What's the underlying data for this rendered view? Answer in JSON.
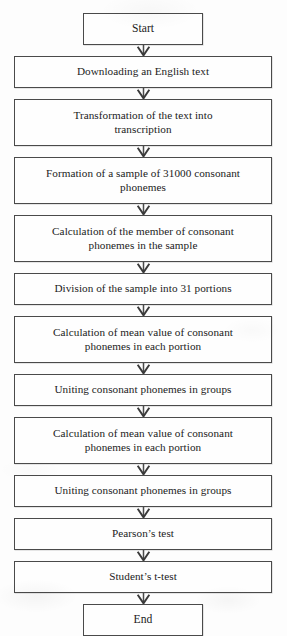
{
  "diagram": {
    "orientation": "top-to-bottom",
    "background_color": "#fdfdfd",
    "border_color": "#4a4a4a",
    "text_color": "#1b1b1b",
    "connector_glyph": "down-arrow",
    "connector_count": 11
  },
  "nodes": [
    {
      "id": "start",
      "shape": "terminal",
      "width": "narrow",
      "lines": 1,
      "label": "Start"
    },
    {
      "id": "download",
      "shape": "process",
      "width": "wide",
      "lines": 1,
      "label": "Downloading an English text"
    },
    {
      "id": "transform",
      "shape": "process",
      "width": "wide",
      "lines": 2,
      "label": "Transformation of the text into\ntranscription"
    },
    {
      "id": "formation",
      "shape": "process",
      "width": "wide",
      "lines": 2,
      "label": "Formation of a sample of 31000 consonant\nphonemes"
    },
    {
      "id": "calc-member",
      "shape": "process",
      "width": "wide",
      "lines": 2,
      "label": "Calculation of the member of consonant\nphonemes in the sample"
    },
    {
      "id": "division",
      "shape": "process",
      "width": "wide",
      "lines": 1,
      "label": "Division of the sample into 31 portions"
    },
    {
      "id": "calc-mean-1",
      "shape": "process",
      "width": "wide",
      "lines": 2,
      "label": "Calculation of mean value of consonant\nphonemes in each portion"
    },
    {
      "id": "uniting-1",
      "shape": "process",
      "width": "wide",
      "lines": 1,
      "label": "Uniting consonant phonemes in groups"
    },
    {
      "id": "calc-mean-2",
      "shape": "process",
      "width": "wide",
      "lines": 2,
      "label": "Calculation of mean value of consonant\nphonemes in each portion"
    },
    {
      "id": "uniting-2",
      "shape": "process",
      "width": "wide",
      "lines": 1,
      "label": "Uniting consonant phonemes in groups"
    },
    {
      "id": "pearson",
      "shape": "process",
      "width": "wide",
      "lines": 1,
      "label": "Pearson’s test"
    },
    {
      "id": "student",
      "shape": "process",
      "width": "wide",
      "lines": 1,
      "label": "Student’s t-test"
    },
    {
      "id": "end",
      "shape": "terminal",
      "width": "narrow",
      "lines": 1,
      "label": "End"
    }
  ]
}
